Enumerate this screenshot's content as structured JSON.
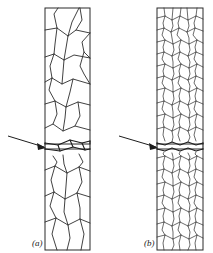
{
  "figure": {
    "kind": "diagram",
    "background_color": "#ffffff",
    "line_color": "#2b2b2b",
    "label_color": "#1a1a1a",
    "width_px": 213,
    "height_px": 253
  },
  "panels": [
    {
      "id": "a",
      "label": "(a)",
      "label_x": 32,
      "label_y": 246,
      "grain_size": "coarse",
      "specimen_rect": {
        "x": 45,
        "y": 8,
        "width": 45,
        "height": 242
      },
      "fracture": {
        "present": true,
        "type": "intergranular-crack",
        "y_center": 148,
        "arrow": {
          "tail_x": 8,
          "tail_y": 136,
          "tip_x": 46,
          "tip_y": 148
        }
      }
    },
    {
      "id": "b",
      "label": "(b)",
      "label_x": 144,
      "label_y": 246,
      "grain_size": "fine",
      "specimen_rect": {
        "x": 157,
        "y": 8,
        "width": 46,
        "height": 242
      },
      "fracture": {
        "present": true,
        "type": "transgranular-crack",
        "y_center": 148,
        "arrow": {
          "tail_x": 119,
          "tail_y": 136,
          "tip_x": 158,
          "tip_y": 148
        }
      }
    }
  ],
  "grain_boundaries_a": [
    "M45 30 L57 28 L68 36 L76 30 L90 33",
    "M57 28 L54 14 L58 8",
    "M68 36 L72 22 L79 8",
    "M76 30 L82 20 L80 8",
    "M45 57 L54 54 L64 60 L74 55 L90 58",
    "M57 28 L55 44 L54 54",
    "M68 36 L66 48 L64 60",
    "M90 33 L82 42 L84 52 L90 58",
    "M45 82 L52 78 L62 84 L73 79 L90 84",
    "M54 54 L50 66 L52 78",
    "M64 60 L63 72 L62 84",
    "M84 52 L80 66 L84 74 L90 84",
    "M45 104 L55 101 L66 107 L78 102 L90 105",
    "M52 78 L49 90 L55 101",
    "M73 79 L70 92 L66 107",
    "M45 128 L53 124 L63 131 L75 126 L90 130",
    "M55 101 L57 114 L53 124",
    "M78 102 L80 116 L75 126",
    "M66 107 L65 118 L63 131",
    "M45 170 L55 166 L67 173 L79 167 L90 171",
    "M53 156 L57 162 L55 166",
    "M63 155 L64 164 L67 173",
    "M79 154 L83 162 L79 167",
    "M45 196 L54 192 L65 199 L77 193 L90 197",
    "M55 166 L51 180 L54 192",
    "M67 173 L66 186 L65 199",
    "M79 167 L82 182 L77 193",
    "M45 222 L56 218 L68 225 L80 219 L90 223",
    "M54 192 L50 206 L56 218",
    "M65 199 L64 212 L68 225",
    "M77 193 L80 208 L80 219",
    "M56 218 L52 234 L57 250",
    "M68 225 L70 238 L67 250",
    "M80 219 L84 234 L81 250"
  ],
  "crack_paths_a": [
    "M45 143 L58 145 L70 140 L82 143 L90 141",
    "M45 149 L60 151 L73 147 L85 150 L90 149",
    "M90 141 L90 149",
    "M45 143 L45 149",
    "M58 145 L60 151",
    "M70 140 L73 147",
    "M82 143 L85 150"
  ],
  "grain_boundaries_b": [
    "M157 18 L165 16 L172 20 L180 16 L188 20 L196 16 L203 19",
    "M165 16 L164 8",
    "M172 20 L173 8",
    "M180 16 L181 8",
    "M188 20 L187 8",
    "M196 16 L197 8",
    "M157 30 L164 28 L171 32 L179 28 L187 32 L195 28 L203 31",
    "M165 16 L163 23 L164 28",
    "M172 20 L173 26 L171 32",
    "M180 16 L178 23 L179 28",
    "M188 20 L189 26 L187 32",
    "M196 16 L194 23 L195 28",
    "M157 42 L165 40 L173 44 L181 40 L189 44 L197 40 L203 43",
    "M164 28 L162 35 L165 40",
    "M171 32 L172 38 L173 44",
    "M179 28 L177 35 L181 40",
    "M187 32 L189 38 L189 44",
    "M195 28 L193 35 L197 40",
    "M157 54 L164 52 L172 56 L180 52 L188 56 L196 52 L203 55",
    "M165 40 L163 47 L164 52",
    "M173 44 L174 50 L172 56",
    "M181 40 L179 47 L180 52",
    "M189 44 L190 50 L188 56",
    "M197 40 L195 47 L196 52",
    "M157 66 L165 64 L173 68 L181 64 L189 68 L197 64 L203 67",
    "M164 52 L162 59 L165 64",
    "M172 56 L173 62 L173 68",
    "M180 52 L178 59 L181 64",
    "M188 56 L190 62 L189 68",
    "M196 52 L194 59 L197 64",
    "M157 78 L164 76 L172 80 L180 76 L188 80 L196 76 L203 79",
    "M165 64 L163 71 L164 76",
    "M173 68 L174 74 L172 80",
    "M181 64 L179 71 L180 76",
    "M189 68 L190 74 L188 80",
    "M197 64 L195 71 L196 76",
    "M157 90 L165 88 L173 92 L181 88 L189 92 L197 88 L203 91",
    "M164 76 L162 83 L165 88",
    "M172 80 L173 86 L173 92",
    "M180 76 L178 83 L181 88",
    "M188 80 L190 86 L189 92",
    "M196 76 L194 83 L197 88",
    "M157 103 L164 101 L172 105 L180 101 L188 105 L196 101 L203 104",
    "M165 88 L163 96 L164 101",
    "M173 92 L174 99 L172 105",
    "M181 88 L179 96 L180 101",
    "M189 92 L190 99 L188 105",
    "M197 88 L195 96 L196 101",
    "M157 116 L165 114 L173 118 L181 114 L189 118 L197 114 L203 117",
    "M164 101 L162 109 L165 114",
    "M172 105 L173 112 L173 118",
    "M180 101 L178 109 L181 114",
    "M188 105 L190 112 L189 118",
    "M196 101 L194 109 L197 114",
    "M157 129 L164 127 L172 131 L180 127 L188 131 L196 127 L203 130",
    "M165 114 L163 122 L164 127",
    "M173 118 L174 125 L172 131",
    "M181 114 L179 122 L180 127",
    "M189 118 L190 125 L188 131",
    "M197 114 L195 122 L196 127",
    "M164 127 L163 135 L165 141",
    "M172 131 L173 137 L172 142",
    "M180 127 L178 135 L180 141",
    "M188 131 L190 137 L188 142",
    "M196 127 L194 135 L196 141",
    "M157 158 L165 156 L173 160 L181 156 L189 160 L197 156 L203 159",
    "M164 152 L163 154 L165 156",
    "M172 153 L173 157 L173 160",
    "M180 152 L179 154 L181 156",
    "M188 153 L190 157 L189 160",
    "M196 152 L195 154 L197 156",
    "M157 171 L164 169 L172 173 L180 169 L188 173 L196 169 L203 172",
    "M165 156 L163 164 L164 169",
    "M173 160 L174 166 L172 173",
    "M181 156 L179 164 L180 169",
    "M189 160 L190 166 L188 173",
    "M197 156 L195 164 L196 169",
    "M157 184 L165 182 L173 186 L181 182 L189 186 L197 182 L203 185",
    "M164 169 L162 177 L165 182",
    "M172 173 L173 179 L173 186",
    "M180 169 L178 177 L181 182",
    "M188 173 L190 179 L189 186",
    "M196 169 L194 177 L197 182",
    "M157 197 L164 195 L172 199 L180 195 L188 199 L196 195 L203 198",
    "M165 182 L163 190 L164 195",
    "M173 186 L174 192 L172 199",
    "M181 182 L179 190 L180 195",
    "M189 186 L190 192 L188 199",
    "M197 182 L195 190 L196 195",
    "M157 210 L165 208 L173 212 L181 208 L189 212 L197 208 L203 211",
    "M164 195 L162 203 L165 208",
    "M172 199 L173 205 L173 212",
    "M180 195 L178 203 L181 208",
    "M188 199 L190 205 L189 212",
    "M196 195 L194 203 L197 208",
    "M157 224 L164 222 L172 226 L180 222 L188 226 L196 222 L203 225",
    "M165 208 L163 216 L164 222",
    "M173 212 L174 219 L172 226",
    "M181 208 L179 216 L180 222",
    "M189 212 L190 219 L188 226",
    "M197 208 L195 216 L196 222",
    "M157 237 L165 235 L173 239 L181 235 L189 239 L197 235 L203 238",
    "M164 222 L162 230 L165 235",
    "M172 226 L173 232 L173 239",
    "M180 222 L178 230 L181 235",
    "M188 226 L190 232 L189 239",
    "M196 222 L194 230 L197 235",
    "M165 235 L163 243 L164 250",
    "M173 239 L174 245 L172 250",
    "M181 235 L179 243 L180 250",
    "M189 239 L190 245 L188 250",
    "M197 235 L195 243 L196 250"
  ],
  "crack_paths_b": [
    "M157 143 L165 145 L172 142 L180 145 L188 142 L196 145 L203 143",
    "M157 149 L165 151 L172 148 L180 151 L188 148 L196 151 L203 149",
    "M157 143 L157 149",
    "M203 143 L203 149"
  ]
}
